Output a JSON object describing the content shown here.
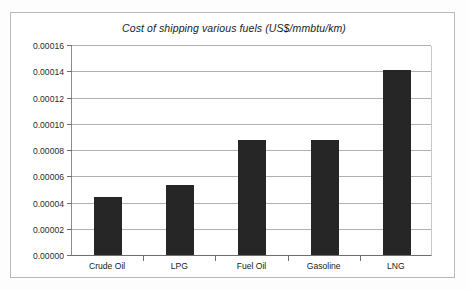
{
  "chart_data": {
    "type": "bar",
    "title": "Cost of shipping various fuels (US$/mmbtu/km)",
    "xlabel": "",
    "ylabel": "",
    "categories": [
      "Crude Oil",
      "LPG",
      "Fuel Oil",
      "Gasoline",
      "LNG"
    ],
    "values": [
      4.45e-05,
      5.35e-05,
      8.75e-05,
      8.75e-05,
      0.000141
    ],
    "series": [
      {
        "name": "Cost of shipping",
        "values": [
          4.45e-05,
          5.35e-05,
          8.75e-05,
          8.75e-05,
          0.000141
        ]
      }
    ],
    "ylim": [
      0.0,
      0.00016
    ],
    "ytick_values": [
      0.0,
      2e-05,
      4e-05,
      6e-05,
      8e-05,
      0.0001,
      0.00012,
      0.00014,
      0.00016
    ],
    "ytick_labels": [
      "0.00000",
      "0.00002",
      "0.00004",
      "0.00006",
      "0.00008",
      "0.00010",
      "0.00012",
      "0.00014",
      "0.00016"
    ],
    "grid": true,
    "legend": false,
    "legend_position": "none",
    "bar_color": "#262626",
    "gridline_color": "#b0b0b0",
    "axis_color": "#6e6e6e",
    "frame_color": "#b9b9b9",
    "background_color": "#ffffff"
  }
}
